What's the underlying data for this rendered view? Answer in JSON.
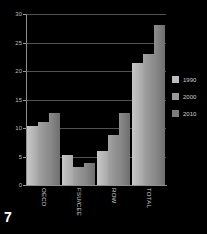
{
  "page": {
    "page_number": "7",
    "background_color": "#000000"
  },
  "legend": {
    "position": "right",
    "items": [
      {
        "label": "1990",
        "color": "#bdbdbd"
      },
      {
        "label": "2000",
        "color": "#9a9a9a"
      },
      {
        "label": "2010",
        "color": "#7e7e7e"
      }
    ]
  },
  "chart_data": {
    "type": "bar",
    "title": "",
    "subtitle": "",
    "xlabel": "",
    "ylabel": "",
    "categories": [
      "OECD",
      "FSU/CEE",
      "ROW",
      "TOTAL"
    ],
    "series": [
      {
        "name": "1990",
        "color": "#bdbdbd",
        "values": [
          10.3,
          5.2,
          5.9,
          21.4
        ]
      },
      {
        "name": "2000",
        "color": "#9a9a9a",
        "values": [
          11.0,
          3.2,
          8.7,
          23.0
        ]
      },
      {
        "name": "2010",
        "color": "#7e7e7e",
        "values": [
          12.7,
          3.9,
          12.7,
          28.0
        ]
      }
    ],
    "ylim": [
      0,
      30
    ],
    "yticks": [
      0,
      5,
      10,
      15,
      20,
      25,
      30
    ],
    "ytick_labels": [
      "0",
      "5",
      "10",
      "15",
      "20",
      "25",
      "30"
    ],
    "grid": true,
    "grid_axis": "y",
    "legend_position": "right",
    "annotations": []
  }
}
